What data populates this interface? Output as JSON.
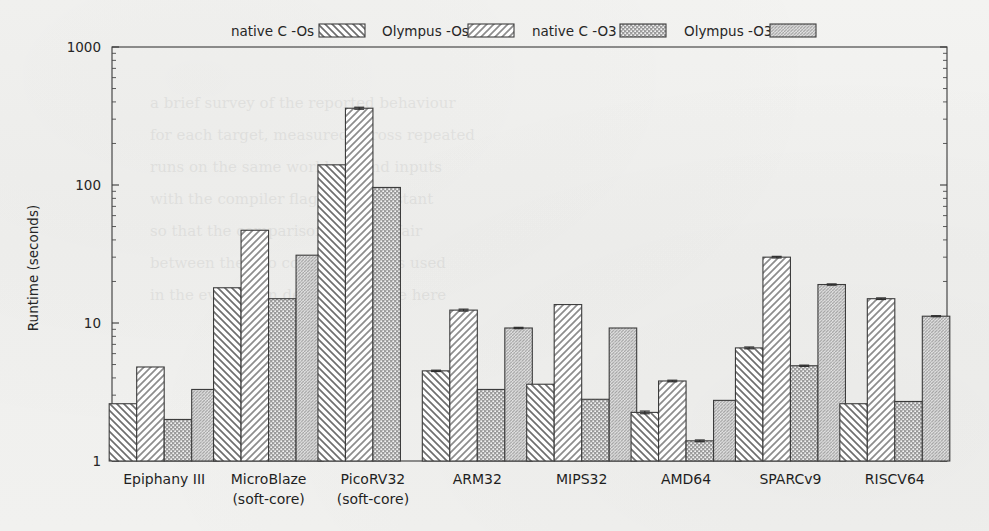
{
  "chart_data": {
    "type": "bar",
    "title": "",
    "xlabel": "",
    "ylabel": "Runtime (seconds)",
    "yscale": "log",
    "ylim": [
      1,
      1000
    ],
    "ytick_labels": [
      "1",
      "10",
      "100",
      "1000"
    ],
    "ytick_values": [
      1,
      10,
      100,
      1000
    ],
    "grid": false,
    "legend_position": "top",
    "categories": [
      "Epiphany III",
      "MicroBlaze\n(soft-core)",
      "PicoRV32\n(soft-core)",
      "ARM32",
      "MIPS32",
      "AMD64",
      "SPARCv9",
      "RISCV64"
    ],
    "category_lines": [
      [
        "Epiphany III"
      ],
      [
        "MicroBlaze",
        "(soft-core)"
      ],
      [
        "PicoRV32",
        "(soft-core)"
      ],
      [
        "ARM32"
      ],
      [
        "MIPS32"
      ],
      [
        "AMD64"
      ],
      [
        "SPARCv9"
      ],
      [
        "RISCV64"
      ]
    ],
    "series": [
      {
        "name": "native C -Os",
        "pattern": "backward-diagonal",
        "values": [
          2.6,
          18.0,
          140.0,
          4.5,
          3.6,
          2.25,
          6.6,
          2.6
        ],
        "errors": [
          0.0,
          0.0,
          0.0,
          0.05,
          0.0,
          0.05,
          0.1,
          0.0
        ]
      },
      {
        "name": "Olympus -Os",
        "pattern": "forward-diagonal",
        "values": [
          4.8,
          47.0,
          360.0,
          12.4,
          13.6,
          3.8,
          30.0,
          15.0
        ],
        "errors": [
          0.0,
          0.0,
          6.0,
          0.2,
          0.0,
          0.05,
          0.4,
          0.2
        ]
      },
      {
        "name": "native C -O3",
        "pattern": "dense-dotted",
        "values": [
          2.0,
          15.0,
          96.0,
          3.3,
          2.8,
          1.4,
          4.9,
          2.7
        ],
        "errors": [
          0.0,
          0.0,
          0.0,
          0.0,
          0.0,
          0.02,
          0.05,
          0.0
        ]
      },
      {
        "name": "Olympus -O3",
        "pattern": "fine-diagonal",
        "values": [
          3.3,
          31.0,
          null,
          9.2,
          9.2,
          2.75,
          19.0,
          11.2
        ],
        "errors": [
          0.0,
          0.0,
          null,
          0.1,
          0.0,
          0.0,
          0.2,
          0.1
        ]
      }
    ]
  },
  "legend": {
    "items": [
      {
        "label": "native C -Os"
      },
      {
        "label": "Olympus -Os"
      },
      {
        "label": "native C -O3"
      },
      {
        "label": "Olympus -O3"
      }
    ]
  }
}
